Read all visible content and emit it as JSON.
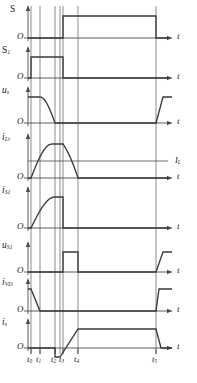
{
  "figure": {
    "type": "timing-waveform-diagram",
    "title": "",
    "width": 197,
    "height": 383,
    "line_color": "#3a3a3a",
    "axis_color": "#4a4a4a",
    "grid_color": "#555555",
    "text_color": "#1a1a1a"
  },
  "time_axis": {
    "origin_x": 28,
    "arrow_x": 172,
    "tick_labels": [
      "t",
      "t",
      "t",
      "t",
      "t",
      "t"
    ],
    "tick_subs": [
      "0",
      "1",
      "2",
      "3",
      "4",
      "5"
    ],
    "tick_x": [
      31,
      40,
      55,
      63,
      78,
      156
    ],
    "axis_symbol": "t"
  },
  "gridlines": {
    "x": [
      31,
      40,
      55,
      60,
      63,
      78,
      156
    ]
  },
  "reference_lines": [
    {
      "name": "I_L",
      "label": "I",
      "sub": "L",
      "row": 3,
      "y_frac": 0.5
    }
  ],
  "rows": [
    {
      "id": "row-s",
      "signal_label": "S",
      "signal_sub": "",
      "zero_label": "O",
      "axis_label": "t",
      "top": 8,
      "baseline": 38,
      "height": 30,
      "amp": 22,
      "show_axis_arrow": true,
      "waveform": {
        "kind": "digital",
        "points": [
          [
            28,
            0
          ],
          [
            63,
            0
          ],
          [
            63,
            1
          ],
          [
            156,
            1
          ],
          [
            156,
            0
          ],
          [
            168,
            0
          ]
        ]
      }
    },
    {
      "id": "row-s1",
      "signal_label": "S",
      "signal_sub": "1",
      "zero_label": "O",
      "axis_label": "t",
      "top": 48,
      "baseline": 78,
      "height": 30,
      "amp": 21,
      "show_axis_arrow": true,
      "waveform": {
        "kind": "digital",
        "points": [
          [
            28,
            0
          ],
          [
            31,
            0
          ],
          [
            31,
            1
          ],
          [
            63,
            1
          ],
          [
            63,
            0
          ],
          [
            168,
            0
          ]
        ]
      }
    },
    {
      "id": "row-us",
      "signal_label": "u",
      "signal_sub": "s",
      "zero_label": "O",
      "axis_label": "t",
      "top": 88,
      "baseline": 123,
      "height": 35,
      "amp": 26,
      "show_axis_arrow": true,
      "waveform": {
        "kind": "us-resonant-fall",
        "flat_start_x": 31,
        "fall_start_x": 40,
        "fall_end_x": 55,
        "rise_start_x": 156,
        "rise_end_x": 163,
        "rise_flat_end_x": 172
      }
    },
    {
      "id": "row-ilr",
      "signal_label": "i",
      "signal_sub": "Lr",
      "zero_label": "O",
      "axis_label": "t",
      "top": 133,
      "baseline": 178,
      "height": 45,
      "amp": 34,
      "show_axis_arrow": true,
      "iref_frac": 0.5,
      "waveform": {
        "kind": "ilr-sine-plateau",
        "rise_start_x": 31,
        "plateau_start_x": 52,
        "plateau_end_x": 63,
        "fall_end_x": 78
      }
    },
    {
      "id": "row-is1",
      "signal_label": "i",
      "signal_sub": "S1",
      "zero_label": "O",
      "axis_label": "t",
      "top": 188,
      "baseline": 228,
      "height": 40,
      "amp": 31,
      "show_axis_arrow": true,
      "waveform": {
        "kind": "is1-sine-drop",
        "rise_start_x": 31,
        "plateau_start_x": 55,
        "drop_x": 63
      }
    },
    {
      "id": "row-us1",
      "signal_label": "u",
      "signal_sub": "S1",
      "zero_label": "O",
      "axis_label": "t",
      "top": 238,
      "baseline": 272,
      "height": 34,
      "amp": 20,
      "show_axis_arrow": true,
      "waveform": {
        "kind": "us1-pulse",
        "pulse_start_x": 63,
        "pulse_end_x": 78,
        "rise_start_x": 156,
        "rise_end_x": 163,
        "rise_flat_end_x": 172
      }
    },
    {
      "id": "row-ivd",
      "signal_label": "i",
      "signal_sub": "VD",
      "zero_label": "O",
      "axis_label": "t",
      "top": 282,
      "baseline": 311,
      "height": 29,
      "amp": 22,
      "show_axis_arrow": true,
      "waveform": {
        "kind": "ivd-ramp-down",
        "start_x": 31,
        "fall_end_x": 40,
        "rise_start_x": 156,
        "rise_end_x": 159,
        "end_x": 172
      }
    },
    {
      "id": "row-isrc",
      "signal_label": "i",
      "signal_sub": "s",
      "zero_label": "O",
      "axis_label": "t",
      "top": 321,
      "baseline": 348,
      "height": 27,
      "amp": 19,
      "show_axis_arrow": true,
      "waveform": {
        "kind": "is-dip-ramp",
        "dip_start_x": 55,
        "dip_end_x": 60,
        "ramp_end_x": 78,
        "fall_start_x": 156,
        "fall_end_x": 161,
        "end_x": 172,
        "dip_depth": 9
      }
    }
  ]
}
